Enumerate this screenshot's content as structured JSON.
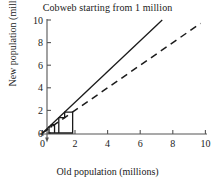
{
  "chart_data": {
    "type": "line",
    "title": "Cobweb starting from 1 million",
    "xlabel": "Old population (millions)",
    "ylabel": "New population (millions)",
    "xlim": [
      0,
      10
    ],
    "ylim": [
      0,
      10
    ],
    "xticks": [
      0,
      2,
      4,
      6,
      8,
      10
    ],
    "yticks": [
      0,
      2,
      4,
      6,
      8,
      10
    ],
    "xtick_labels": [
      "0",
      "2",
      "4",
      "6",
      "8",
      "10"
    ],
    "ytick_labels": [
      "0",
      "2",
      "4",
      "6",
      "8",
      "10"
    ],
    "grid": false,
    "legend": "none",
    "series": [
      {
        "name": "updating function",
        "style": "solid",
        "color": "#1a1a1a",
        "slope": 1.36,
        "intercept": 0,
        "x": [
          0,
          7.35
        ],
        "y": [
          0,
          10
        ]
      },
      {
        "name": "diagonal y = x",
        "style": "dashed",
        "color": "#1a1a1a",
        "slope": 1.0,
        "intercept": 0,
        "x": [
          0,
          9.7
        ],
        "y": [
          0,
          9.7
        ]
      },
      {
        "name": "cobweb staircase",
        "style": "solid",
        "color": "#1a1a1a",
        "start": 1.0,
        "points_x": [
          1.0,
          1.0,
          1.36,
          1.36,
          1.85,
          1.85,
          0.4,
          0.4,
          0.55,
          0.55,
          0.74,
          0.74
        ],
        "points_y": [
          0.0,
          1.36,
          1.36,
          1.85,
          1.85,
          0.0,
          0.0,
          0.55,
          0.55,
          0.74,
          0.74,
          0.0
        ]
      }
    ]
  },
  "axes": {
    "x_axis_name": "x-axis",
    "y_axis_name": "y-axis"
  }
}
